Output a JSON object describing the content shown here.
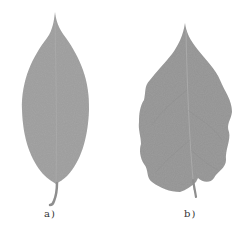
{
  "figure": {
    "panels": [
      {
        "label": "a)",
        "subject": "smooth-edged elliptical leaf",
        "color": "#a4a4a4"
      },
      {
        "label": "b)",
        "subject": "wavy-edged ovate leaf",
        "color": "#9a9a9a"
      }
    ],
    "background": "#ffffff"
  }
}
